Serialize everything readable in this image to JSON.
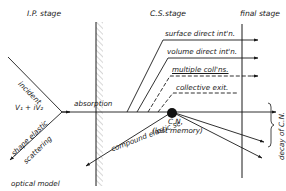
{
  "stages": {
    "ip": "I.P. stage",
    "cs": "C.S.stage",
    "final": "final stage"
  },
  "labels": {
    "incident": "incident",
    "potential": "V₁ + iV₂",
    "absorption": "absorption",
    "shape_elastic": "shape elastic",
    "scattering": "scattering",
    "optical_model": "optical model",
    "surface_direct": "surface direct int'n.",
    "volume_direct": "volume direct int'n.",
    "multiple_collisions": "multiple coll'ns.",
    "collective_exit": "collective exit.",
    "compound_elastic": "compound elastic sc.",
    "compound_nucleus": "C.N.",
    "lost_memory": "(lost memory)",
    "decay": "decay of C.N."
  },
  "colors": {
    "ink": "#1a1a1a",
    "hatch": "#9a9a9a",
    "background": "#ffffff"
  }
}
